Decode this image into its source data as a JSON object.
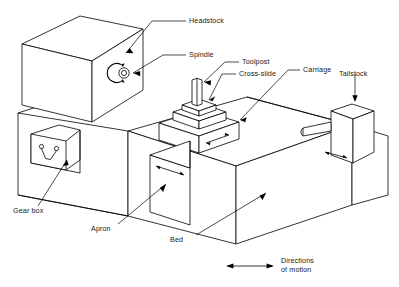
{
  "figure": {
    "labels": {
      "headstock": "Headstock",
      "spindle": "Spindle",
      "toolpost": "Toolpost",
      "cross_slide": "Cross-slide",
      "carriage": "Carriage",
      "tailstock": "Tailstock",
      "gear_box": "Gear box",
      "apron": "Apron",
      "bed": "Bed"
    },
    "legend": {
      "line1": "Directions",
      "line2": "of motion",
      "symbol": "double-headed-arrow"
    },
    "colors": {
      "stroke": "#000000",
      "fill": "#ffffff",
      "text": "#1a1a1a"
    },
    "motion_arrows": [
      {
        "name": "spindle-rotation",
        "type": "rotary"
      },
      {
        "name": "toolpost-cross-travel",
        "type": "linear"
      },
      {
        "name": "cross-slide-travel",
        "type": "linear"
      },
      {
        "name": "carriage-longitudinal-travel",
        "type": "linear"
      },
      {
        "name": "tailstock-quill-travel",
        "type": "linear"
      }
    ]
  }
}
